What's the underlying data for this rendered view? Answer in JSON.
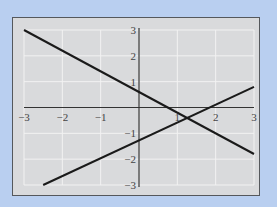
{
  "chart_data": {
    "type": "line",
    "title": "",
    "xlabel": "",
    "ylabel": "",
    "xlim": [
      -3,
      3
    ],
    "ylim": [
      -3,
      3
    ],
    "grid": true,
    "x_ticks": [
      "-3",
      "-2",
      "-1",
      "1",
      "2",
      "3"
    ],
    "y_ticks": [
      "3",
      "2",
      "1",
      "-1",
      "-2",
      "-3"
    ],
    "series": [
      {
        "name": "decreasing line",
        "x": [
          -3,
          3
        ],
        "y": [
          3,
          -1.8
        ]
      },
      {
        "name": "increasing line",
        "x": [
          -2.5,
          3
        ],
        "y": [
          -3,
          0.8
        ]
      }
    ]
  },
  "colors": {
    "background": "#b9cff0",
    "plot_bg": "#d9dadc",
    "line": "#1a1a1a",
    "grid": "#f2f2f2"
  }
}
